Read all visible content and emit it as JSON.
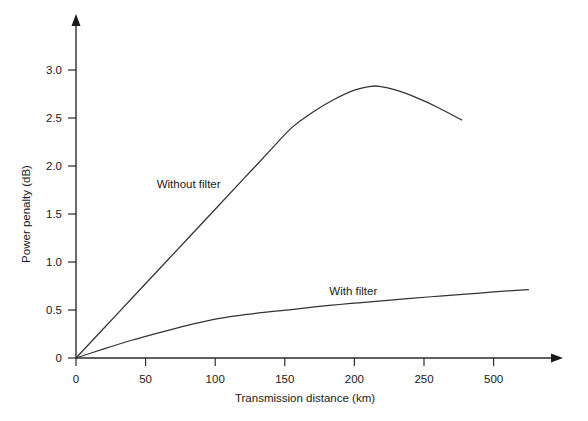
{
  "chart_data": {
    "type": "line",
    "title": "",
    "subtitle": "",
    "xlabel": "Transmission distance   (km)",
    "xlabel_main": "Transmission distance",
    "xlabel_unit": "(km)",
    "ylabel": "Power penalty (dB)",
    "xlim": [
      0,
      350
    ],
    "ylim": [
      0,
      3.25
    ],
    "grid": false,
    "legend_position": "inline-annotations",
    "x_ticks": [
      0,
      50,
      100,
      150,
      200,
      250,
      300
    ],
    "x_tick_labels": [
      "0",
      "50",
      "100",
      "150",
      "200",
      "250",
      "500"
    ],
    "y_ticks": [
      0,
      0.5,
      1.0,
      1.5,
      2.0,
      2.5,
      3.0
    ],
    "y_tick_labels": [
      "0",
      "0.5",
      "1.0",
      "1.5",
      "2.0",
      "2.5",
      "3.0"
    ],
    "axis_style": "arrow-tipped-L",
    "line_color": "#333333",
    "series": [
      {
        "name": "Without filter",
        "label": "Without filter",
        "label_x_km": 58,
        "label_y_db": 1.77,
        "x": [
          0,
          20,
          40,
          60,
          80,
          100,
          120,
          140,
          155,
          170,
          185,
          200,
          212,
          218,
          230,
          245,
          260,
          277
        ],
        "values": [
          0,
          0.31,
          0.62,
          0.93,
          1.24,
          1.55,
          1.86,
          2.17,
          2.4,
          2.56,
          2.69,
          2.79,
          2.83,
          2.83,
          2.79,
          2.71,
          2.61,
          2.48
        ]
      },
      {
        "name": "With filter",
        "label": "With filter",
        "label_x_km": 182,
        "label_y_db": 0.66,
        "x": [
          0,
          20,
          40,
          60,
          80,
          100,
          115,
          135,
          155,
          180,
          205,
          230,
          255,
          280,
          300,
          325
        ],
        "values": [
          0,
          0.095,
          0.185,
          0.265,
          0.34,
          0.405,
          0.44,
          0.475,
          0.505,
          0.545,
          0.578,
          0.608,
          0.638,
          0.665,
          0.688,
          0.712
        ]
      }
    ],
    "annotations": [
      {
        "text": "Without filter",
        "x_km": 58,
        "y_db": 1.77
      },
      {
        "text": "With filter",
        "x_km": 182,
        "y_db": 0.66
      }
    ]
  }
}
